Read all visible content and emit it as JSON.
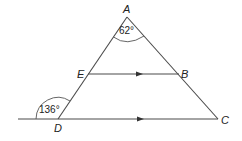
{
  "figure": {
    "type": "geometry-diagram",
    "points": {
      "A": {
        "label": "A",
        "x": 127,
        "y": 17
      },
      "B": {
        "label": "B",
        "x": 179,
        "y": 74
      },
      "C": {
        "label": "C",
        "x": 218,
        "y": 119
      },
      "D": {
        "label": "D",
        "x": 58,
        "y": 119
      },
      "E": {
        "label": "E",
        "x": 88,
        "y": 74
      }
    },
    "segments": [
      {
        "from": "A",
        "to": "D"
      },
      {
        "from": "A",
        "to": "C"
      },
      {
        "from": "E",
        "to": "B",
        "parallel_marker": true
      },
      {
        "from": "left-extension",
        "to": "C",
        "through": "D",
        "parallel_marker": true
      }
    ],
    "angles": {
      "angle_A": {
        "label": "62°",
        "vertex": "A"
      },
      "angle_D_exterior": {
        "label": "136°",
        "vertex": "D"
      }
    },
    "stroke_color": "#4a4a4a",
    "background": "#ffffff"
  }
}
